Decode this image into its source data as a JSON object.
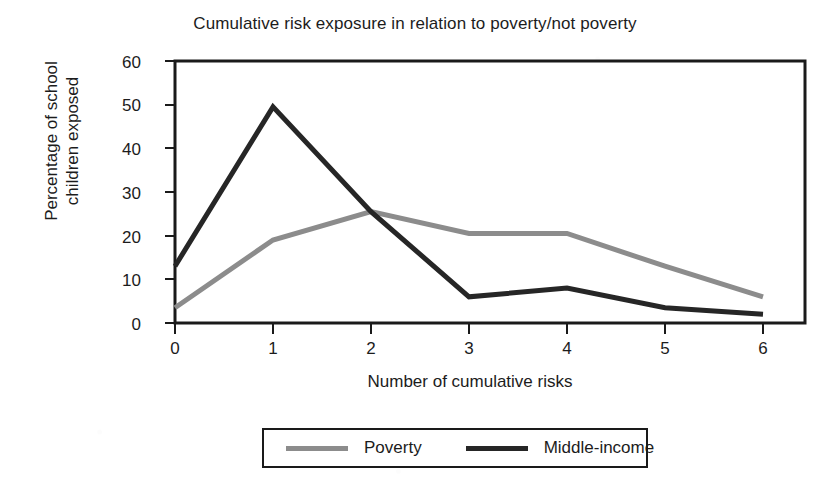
{
  "chart_data": {
    "type": "line",
    "title": "Cumulative risk exposure in relation to poverty/not poverty",
    "xlabel": "Number of cumulative risks",
    "ylabel_lines": [
      "Percentage of school",
      "children exposed"
    ],
    "ylabel": "Percentage of school children exposed",
    "categories": [
      0,
      1,
      2,
      3,
      4,
      5,
      6
    ],
    "x": [
      0,
      1,
      2,
      3,
      4,
      5,
      6
    ],
    "xtick_labels": [
      "0",
      "1",
      "2",
      "3",
      "4",
      "5",
      "6"
    ],
    "ytick_labels": [
      "0",
      "10",
      "20",
      "30",
      "40",
      "50",
      "60"
    ],
    "yticks": [
      0,
      10,
      20,
      30,
      40,
      50,
      60
    ],
    "xlim": [
      0,
      6.4
    ],
    "ylim": [
      0,
      60
    ],
    "grid": false,
    "legend_position": "below-center",
    "series": [
      {
        "name": "Poverty",
        "color": "#8c8c8c",
        "values": [
          3.5,
          19,
          25.5,
          20.5,
          20.5,
          13,
          6
        ]
      },
      {
        "name": "Middle-income",
        "color": "#262626",
        "values": [
          13,
          49.5,
          25.5,
          6,
          8,
          3.5,
          2
        ]
      }
    ]
  },
  "axes": {
    "frame_color": "#1a1a1a"
  },
  "legend": {
    "entries": [
      {
        "label": "Poverty",
        "color": "#8c8c8c"
      },
      {
        "label": "Middle-income",
        "color": "#262626"
      }
    ]
  }
}
